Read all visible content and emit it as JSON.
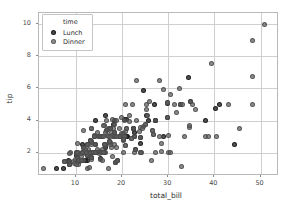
{
  "chart_data": {
    "type": "scatter",
    "title": "",
    "xlabel": "total_bill",
    "ylabel": "tip",
    "xlim": [
      2.0,
      54.0
    ],
    "ylim": [
      0.55,
      10.7
    ],
    "xticks": [
      10,
      20,
      30,
      40,
      50
    ],
    "yticks": [
      2,
      4,
      6,
      8,
      10
    ],
    "xtick_labels": [
      "10",
      "20",
      "30",
      "40",
      "50"
    ],
    "ytick_labels": [
      "2",
      "4",
      "6",
      "8",
      "10"
    ],
    "grid": true,
    "legend": {
      "title": "time",
      "position": "upper left",
      "entries": [
        {
          "label": "Lunch",
          "color": "#282828",
          "marker": "circle"
        },
        {
          "label": "Dinner",
          "color": "#5f5f5f",
          "marker": "circle"
        }
      ]
    },
    "series": [
      {
        "name": "Lunch",
        "color": "#282828",
        "points": [
          [
            27.2,
            4.0
          ],
          [
            22.76,
            3.0
          ],
          [
            17.29,
            2.71
          ],
          [
            19.44,
            3.0
          ],
          [
            16.66,
            3.4
          ],
          [
            10.07,
            1.83
          ],
          [
            32.68,
            5.0
          ],
          [
            15.98,
            2.03
          ],
          [
            34.83,
            5.17
          ],
          [
            13.03,
            2.0
          ],
          [
            18.28,
            4.0
          ],
          [
            24.71,
            5.85
          ],
          [
            21.16,
            3.0
          ],
          [
            28.97,
            3.0
          ],
          [
            22.49,
            3.5
          ],
          [
            5.75,
            1.0
          ],
          [
            16.32,
            4.3
          ],
          [
            22.75,
            3.25
          ],
          [
            40.17,
            4.73
          ],
          [
            27.28,
            4.0
          ],
          [
            12.03,
            1.5
          ],
          [
            21.01,
            3.0
          ],
          [
            12.46,
            1.5
          ],
          [
            11.35,
            2.5
          ],
          [
            15.38,
            3.0
          ],
          [
            44.3,
            2.5
          ],
          [
            22.42,
            3.48
          ],
          [
            20.92,
            4.08
          ],
          [
            15.36,
            1.64
          ],
          [
            20.49,
            4.06
          ],
          [
            25.21,
            4.29
          ],
          [
            18.24,
            3.76
          ],
          [
            14.31,
            4.0
          ],
          [
            14.0,
            3.0
          ],
          [
            7.25,
            1.0
          ],
          [
            38.07,
            4.0
          ],
          [
            23.95,
            2.55
          ],
          [
            25.71,
            4.0
          ],
          [
            17.31,
            3.5
          ],
          [
            29.93,
            5.07
          ],
          [
            10.65,
            1.5
          ],
          [
            12.43,
            1.8
          ],
          [
            24.08,
            2.92
          ],
          [
            11.69,
            2.31
          ],
          [
            13.42,
            1.68
          ],
          [
            14.26,
            2.5
          ],
          [
            15.95,
            2.0
          ],
          [
            12.48,
            2.52
          ],
          [
            29.8,
            4.2
          ],
          [
            8.52,
            1.48
          ],
          [
            14.52,
            2.0
          ],
          [
            11.38,
            2.0
          ],
          [
            22.82,
            2.18
          ],
          [
            19.08,
            1.5
          ],
          [
            20.27,
            2.83
          ],
          [
            11.17,
            1.5
          ],
          [
            12.26,
            2.0
          ],
          [
            18.26,
            3.25
          ],
          [
            8.51,
            1.25
          ],
          [
            10.33,
            2.0
          ],
          [
            14.15,
            2.0
          ],
          [
            16.0,
            2.0
          ],
          [
            13.16,
            2.75
          ],
          [
            17.47,
            3.5
          ],
          [
            34.3,
            6.7
          ],
          [
            41.19,
            5.0
          ],
          [
            27.05,
            5.0
          ],
          [
            16.43,
            2.3
          ],
          [
            8.35,
            1.5
          ],
          [
            18.64,
            1.36
          ]
        ]
      },
      {
        "name": "Dinner",
        "color": "#5f5f5f",
        "points": [
          [
            16.99,
            1.01
          ],
          [
            10.34,
            1.66
          ],
          [
            21.01,
            3.5
          ],
          [
            23.68,
            3.31
          ],
          [
            24.59,
            3.61
          ],
          [
            25.29,
            4.71
          ],
          [
            8.77,
            2.0
          ],
          [
            26.88,
            3.12
          ],
          [
            15.04,
            1.96
          ],
          [
            14.78,
            3.23
          ],
          [
            10.27,
            1.71
          ],
          [
            35.26,
            5.0
          ],
          [
            15.42,
            1.57
          ],
          [
            18.43,
            3.0
          ],
          [
            14.83,
            3.02
          ],
          [
            21.58,
            3.92
          ],
          [
            10.33,
            1.67
          ],
          [
            16.29,
            3.71
          ],
          [
            16.97,
            3.5
          ],
          [
            20.65,
            3.35
          ],
          [
            17.92,
            4.08
          ],
          [
            20.29,
            2.75
          ],
          [
            15.77,
            2.23
          ],
          [
            39.42,
            7.58
          ],
          [
            19.82,
            3.18
          ],
          [
            17.81,
            2.34
          ],
          [
            13.37,
            2.0
          ],
          [
            12.69,
            2.0
          ],
          [
            21.7,
            4.3
          ],
          [
            19.65,
            3.0
          ],
          [
            9.55,
            1.45
          ],
          [
            18.35,
            2.5
          ],
          [
            15.06,
            3.0
          ],
          [
            20.69,
            2.45
          ],
          [
            17.78,
            3.27
          ],
          [
            24.06,
            3.6
          ],
          [
            16.31,
            2.0
          ],
          [
            16.93,
            3.07
          ],
          [
            18.69,
            2.31
          ],
          [
            31.27,
            5.0
          ],
          [
            16.04,
            3.71
          ],
          [
            17.46,
            2.54
          ],
          [
            13.94,
            3.06
          ],
          [
            9.68,
            1.32
          ],
          [
            30.4,
            5.6
          ],
          [
            18.29,
            3.0
          ],
          [
            22.23,
            5.0
          ],
          [
            32.4,
            6.0
          ],
          [
            28.55,
            2.05
          ],
          [
            18.04,
            3.0
          ],
          [
            12.54,
            2.5
          ],
          [
            10.29,
            2.6
          ],
          [
            34.81,
            5.2
          ],
          [
            9.94,
            1.56
          ],
          [
            25.56,
            4.34
          ],
          [
            19.49,
            3.51
          ],
          [
            38.01,
            3.0
          ],
          [
            26.41,
            1.5
          ],
          [
            11.24,
            1.76
          ],
          [
            48.27,
            6.73
          ],
          [
            20.29,
            3.21
          ],
          [
            13.81,
            2.0
          ],
          [
            11.02,
            1.98
          ],
          [
            18.29,
            3.76
          ],
          [
            17.59,
            2.64
          ],
          [
            20.08,
            3.15
          ],
          [
            16.45,
            2.47
          ],
          [
            3.07,
            1.0
          ],
          [
            20.23,
            2.01
          ],
          [
            15.01,
            2.09
          ],
          [
            12.02,
            1.97
          ],
          [
            17.07,
            3.0
          ],
          [
            26.86,
            3.14
          ],
          [
            25.28,
            5.0
          ],
          [
            14.73,
            2.2
          ],
          [
            10.51,
            1.25
          ],
          [
            17.92,
            3.08
          ],
          [
            27.2,
            4.0
          ],
          [
            22.76,
            3.0
          ],
          [
            17.29,
            2.71
          ],
          [
            19.44,
            3.0
          ],
          [
            16.66,
            3.4
          ],
          [
            32.68,
            5.0
          ],
          [
            15.98,
            2.03
          ],
          [
            13.42,
            3.48
          ],
          [
            16.27,
            2.5
          ],
          [
            10.09,
            2.0
          ],
          [
            20.45,
            3.0
          ],
          [
            13.28,
            2.72
          ],
          [
            22.12,
            2.88
          ],
          [
            24.01,
            2.0
          ],
          [
            15.69,
            3.0
          ],
          [
            11.61,
            3.39
          ],
          [
            10.77,
            1.47
          ],
          [
            15.53,
            3.0
          ],
          [
            10.07,
            1.25
          ],
          [
            12.6,
            1.0
          ],
          [
            32.83,
            1.17
          ],
          [
            35.83,
            4.67
          ],
          [
            29.03,
            5.92
          ],
          [
            27.18,
            2.0
          ],
          [
            22.67,
            2.0
          ],
          [
            17.82,
            1.75
          ],
          [
            18.78,
            3.0
          ],
          [
            7.56,
            1.44
          ],
          [
            10.34,
            2.0
          ],
          [
            43.11,
            5.0
          ],
          [
            13.0,
            2.0
          ],
          [
            13.51,
            2.0
          ],
          [
            18.71,
            4.0
          ],
          [
            12.74,
            2.01
          ],
          [
            13.0,
            2.0
          ],
          [
            16.4,
            2.5
          ],
          [
            20.53,
            4.0
          ],
          [
            16.47,
            3.23
          ],
          [
            26.59,
            3.41
          ],
          [
            38.73,
            3.0
          ],
          [
            24.27,
            2.03
          ],
          [
            12.76,
            2.23
          ],
          [
            30.06,
            2.0
          ],
          [
            25.89,
            5.16
          ],
          [
            48.33,
            9.0
          ],
          [
            13.27,
            2.5
          ],
          [
            28.17,
            6.5
          ],
          [
            12.9,
            1.1
          ],
          [
            28.15,
            3.0
          ],
          [
            11.59,
            1.5
          ],
          [
            7.74,
            1.44
          ],
          [
            30.14,
            3.09
          ],
          [
            12.16,
            2.2
          ],
          [
            13.42,
            1.58
          ],
          [
            8.58,
            1.92
          ],
          [
            15.98,
            3.0
          ],
          [
            13.42,
            3.48
          ],
          [
            16.27,
            2.5
          ],
          [
            10.09,
            2.0
          ],
          [
            20.45,
            3.0
          ],
          [
            13.28,
            2.72
          ],
          [
            22.12,
            2.88
          ],
          [
            24.01,
            2.0
          ],
          [
            50.81,
            10.0
          ],
          [
            45.35,
            3.5
          ],
          [
            23.17,
            6.5
          ],
          [
            40.55,
            3.0
          ],
          [
            20.69,
            5.0
          ],
          [
            20.9,
            3.5
          ],
          [
            30.46,
            2.0
          ],
          [
            18.15,
            3.5
          ],
          [
            23.1,
            4.0
          ],
          [
            15.69,
            1.5
          ],
          [
            19.81,
            4.19
          ],
          [
            28.44,
            2.56
          ],
          [
            15.48,
            2.02
          ],
          [
            16.58,
            4.0
          ],
          [
            7.56,
            1.44
          ],
          [
            10.34,
            2.0
          ],
          [
            17.29,
            2.71
          ],
          [
            31.71,
            4.5
          ],
          [
            26.59,
            3.41
          ],
          [
            22.42,
            3.48
          ],
          [
            33.16,
            5.0
          ],
          [
            34.63,
            3.55
          ],
          [
            33.5,
            3.0
          ],
          [
            20.69,
            2.45
          ],
          [
            29.85,
            5.14
          ],
          [
            34.65,
            3.68
          ],
          [
            24.52,
            3.48
          ],
          [
            25.0,
            3.75
          ],
          [
            18.64,
            1.36
          ],
          [
            14.0,
            3.0
          ],
          [
            29.85,
            5.14
          ],
          [
            48.17,
            5.0
          ],
          [
            25.0,
            3.75
          ],
          [
            13.39,
            2.61
          ],
          [
            16.21,
            2.0
          ],
          [
            17.51,
            3.0
          ],
          [
            10.65,
            1.5
          ],
          [
            12.43,
            1.8
          ],
          [
            24.08,
            2.92
          ],
          [
            11.69,
            2.31
          ],
          [
            13.42,
            1.68
          ],
          [
            14.26,
            2.5
          ],
          [
            15.95,
            2.0
          ],
          [
            12.48,
            2.52
          ],
          [
            29.8,
            4.2
          ],
          [
            8.52,
            1.48
          ],
          [
            14.52,
            2.0
          ],
          [
            11.38,
            2.0
          ],
          [
            22.82,
            2.18
          ],
          [
            19.08,
            1.5
          ],
          [
            20.27,
            2.83
          ],
          [
            11.17,
            1.5
          ],
          [
            12.26,
            2.0
          ],
          [
            18.26,
            3.25
          ],
          [
            8.51,
            1.25
          ],
          [
            10.33,
            2.0
          ],
          [
            14.15,
            2.0
          ],
          [
            16.0,
            2.0
          ],
          [
            13.16,
            2.75
          ],
          [
            17.47,
            3.5
          ]
        ]
      }
    ]
  }
}
